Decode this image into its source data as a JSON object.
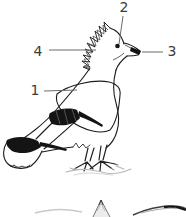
{
  "figure": {
    "background_color": "#ffffff",
    "ink_color": "#1c1c1c",
    "leader_line_color": "#6b6b6b",
    "label_color": "#3c3c3c",
    "callouts": [
      {
        "text": "1"
      },
      {
        "text": "2"
      },
      {
        "text": "3"
      },
      {
        "text": "4"
      }
    ]
  }
}
